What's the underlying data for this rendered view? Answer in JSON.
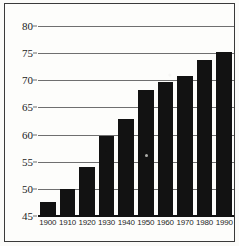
{
  "chart_data": {
    "type": "bar",
    "title": "",
    "xlabel": "",
    "ylabel": "",
    "categories": [
      "1900",
      "1910",
      "1920",
      "1930",
      "1940",
      "1950",
      "1960",
      "1970",
      "1980",
      "1990"
    ],
    "values": [
      47.5,
      50.0,
      54.1,
      59.7,
      62.9,
      68.2,
      69.7,
      70.8,
      73.8,
      75.2
    ],
    "ylim": [
      45,
      80
    ],
    "ytick_labels": [
      "45",
      "50",
      "55",
      "60",
      "65",
      "70",
      "75",
      "80"
    ],
    "ytick_values": [
      45,
      50,
      55,
      60,
      65,
      70,
      75,
      80
    ],
    "grid": "horizontal",
    "legend": "none",
    "bar_color": "#121212",
    "grid_color": "#6f6f6f",
    "axis_color": "#121212",
    "background_color": "#fdfdfb",
    "frame_color": "#3a3a3a"
  }
}
